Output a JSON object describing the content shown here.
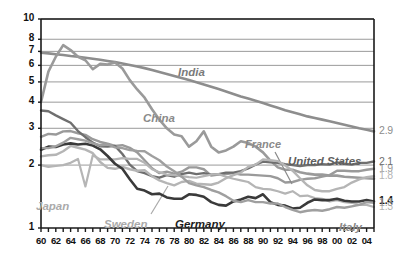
{
  "chart_data": {
    "type": "line",
    "title": "",
    "subtitle": "",
    "xlabel": "",
    "ylabel": "",
    "scale": "log",
    "grid": true,
    "legend_position": "inline-labels",
    "xlim": [
      1960,
      2005
    ],
    "ylim": [
      1,
      10
    ],
    "y_ticks": [
      "10",
      "8",
      "7",
      "6",
      "5",
      "4",
      "3",
      "2",
      "1"
    ],
    "y_tick_values": [
      10,
      8,
      7,
      6,
      5,
      4,
      3,
      2,
      1
    ],
    "x_ticks": [
      "60",
      "62",
      "64",
      "66",
      "68",
      "70",
      "72",
      "74",
      "76",
      "78",
      "80",
      "82",
      "84",
      "86",
      "88",
      "90",
      "92",
      "94",
      "96",
      "98",
      "00",
      "02",
      "04"
    ],
    "x_tick_values": [
      1960,
      1962,
      1964,
      1966,
      1968,
      1970,
      1972,
      1974,
      1976,
      1978,
      1980,
      1982,
      1984,
      1986,
      1988,
      1990,
      1992,
      1994,
      1996,
      1998,
      2000,
      2002,
      2004
    ],
    "x": [
      1960,
      1961,
      1962,
      1963,
      1964,
      1965,
      1966,
      1967,
      1968,
      1969,
      1970,
      1971,
      1972,
      1973,
      1974,
      1975,
      1976,
      1977,
      1978,
      1979,
      1980,
      1981,
      1982,
      1983,
      1984,
      1985,
      1986,
      1987,
      1988,
      1989,
      1990,
      1991,
      1992,
      1993,
      1994,
      1995,
      1996,
      1997,
      1998,
      1999,
      2000,
      2001,
      2002,
      2003,
      2004,
      2005
    ],
    "series": [
      {
        "name": "India",
        "color": "#8d8d8d",
        "width": 2.6,
        "end_value": "2.9",
        "end_value_color": "#8d8d8d",
        "end_value_bold": false,
        "label": "India",
        "label_color": "#7a7a7a",
        "label_size": 11.5,
        "label_x": 178,
        "label_y": 66,
        "values": [
          6.9,
          6.85,
          6.78,
          6.72,
          6.65,
          6.6,
          6.52,
          6.45,
          6.38,
          6.3,
          6.22,
          6.12,
          6.02,
          5.92,
          5.82,
          5.7,
          5.58,
          5.46,
          5.34,
          5.22,
          5.1,
          4.98,
          4.86,
          4.74,
          4.62,
          4.5,
          4.38,
          4.26,
          4.16,
          4.06,
          3.96,
          3.86,
          3.76,
          3.66,
          3.58,
          3.5,
          3.42,
          3.36,
          3.3,
          3.24,
          3.18,
          3.12,
          3.06,
          3.0,
          2.95,
          2.9
        ]
      },
      {
        "name": "China",
        "color": "#9a9a9a",
        "width": 2.6,
        "end_value": "",
        "end_value_color": "#9a9a9a",
        "end_value_bold": false,
        "label": "China",
        "label_color": "#8a8a8a",
        "label_size": 11.5,
        "label_x": 143,
        "label_y": 112,
        "values": [
          4.0,
          5.6,
          6.6,
          7.5,
          7.1,
          6.6,
          6.35,
          5.75,
          6.1,
          6.05,
          6.2,
          5.8,
          5.1,
          4.6,
          4.2,
          3.7,
          3.3,
          3.0,
          2.8,
          2.75,
          2.45,
          2.6,
          2.9,
          2.45,
          2.3,
          2.35,
          2.45,
          2.6,
          2.55,
          2.45,
          2.3,
          2.1,
          1.95,
          1.9,
          1.9,
          1.85,
          1.82,
          1.8,
          1.8,
          1.78,
          1.78,
          1.76,
          1.75,
          1.74,
          1.73,
          1.72
        ]
      },
      {
        "name": "France",
        "color": "#9a9a9a",
        "width": 2.4,
        "end_value": "1.9",
        "end_value_color": "#9a9a9a",
        "end_value_bold": false,
        "label": "France",
        "label_color": "#8a8a8a",
        "label_size": 11,
        "label_x": 245,
        "label_y": 138,
        "leader": [
          275,
          152,
          292,
          184
        ],
        "values": [
          2.73,
          2.82,
          2.8,
          2.9,
          2.91,
          2.84,
          2.79,
          2.66,
          2.58,
          2.53,
          2.47,
          2.49,
          2.42,
          2.3,
          2.11,
          1.93,
          1.83,
          1.86,
          1.82,
          1.86,
          1.95,
          1.95,
          1.91,
          1.78,
          1.8,
          1.81,
          1.83,
          1.8,
          1.8,
          1.79,
          1.78,
          1.77,
          1.73,
          1.65,
          1.66,
          1.7,
          1.72,
          1.73,
          1.76,
          1.79,
          1.88,
          1.88,
          1.87,
          1.87,
          1.9,
          1.92
        ]
      },
      {
        "name": "United States",
        "color": "#6f6f6f",
        "width": 2.4,
        "end_value": "2.1",
        "end_value_color": "#6f6f6f",
        "end_value_bold": false,
        "label": "United States",
        "label_color": "#5e5e5e",
        "label_size": 11.5,
        "label_x": 288,
        "label_y": 155,
        "values": [
          3.65,
          3.62,
          3.46,
          3.32,
          3.19,
          2.91,
          2.72,
          2.56,
          2.46,
          2.45,
          2.47,
          2.26,
          2.01,
          1.87,
          1.83,
          1.77,
          1.74,
          1.79,
          1.76,
          1.81,
          1.84,
          1.81,
          1.83,
          1.8,
          1.81,
          1.84,
          1.84,
          1.87,
          1.93,
          2.01,
          2.08,
          2.06,
          2.05,
          2.02,
          2.0,
          1.98,
          2.0,
          2.0,
          2.02,
          2.01,
          2.06,
          2.03,
          2.01,
          2.05,
          2.05,
          2.08
        ]
      },
      {
        "name": "Sweden",
        "color": "#b5b5b5",
        "width": 2.4,
        "end_value": "1.8",
        "end_value_color": "#b5b5b5",
        "end_value_bold": false,
        "label": "Sweden",
        "label_color": "#aaaaaa",
        "label_size": 11.5,
        "label_x": 104,
        "label_y": 218,
        "leader": [
          151,
          214,
          168,
          186
        ],
        "values": [
          2.2,
          2.23,
          2.24,
          2.33,
          2.47,
          2.42,
          2.37,
          2.28,
          2.07,
          1.94,
          1.92,
          1.96,
          1.91,
          1.88,
          1.89,
          1.77,
          1.69,
          1.64,
          1.6,
          1.66,
          1.68,
          1.63,
          1.62,
          1.61,
          1.65,
          1.73,
          1.79,
          1.84,
          1.96,
          2.01,
          2.13,
          2.11,
          2.09,
          1.99,
          1.88,
          1.73,
          1.6,
          1.52,
          1.5,
          1.5,
          1.54,
          1.57,
          1.65,
          1.71,
          1.75,
          1.77
        ]
      },
      {
        "name": "Japan",
        "color": "#b5b5b5",
        "width": 2.2,
        "end_value": "1.3",
        "end_value_color": "#b5b5b5",
        "end_value_bold": false,
        "label": "Japan",
        "label_color": "#aaaaaa",
        "label_size": 11.5,
        "label_x": 36,
        "label_y": 200,
        "values": [
          2.0,
          1.96,
          1.98,
          2.0,
          2.05,
          2.14,
          1.58,
          2.23,
          2.13,
          2.13,
          2.13,
          2.16,
          2.14,
          2.14,
          2.05,
          1.91,
          1.85,
          1.8,
          1.79,
          1.77,
          1.75,
          1.74,
          1.77,
          1.8,
          1.81,
          1.76,
          1.72,
          1.69,
          1.66,
          1.57,
          1.54,
          1.53,
          1.5,
          1.46,
          1.5,
          1.42,
          1.43,
          1.39,
          1.38,
          1.34,
          1.36,
          1.33,
          1.32,
          1.29,
          1.29,
          1.26
        ]
      },
      {
        "name": "Germany",
        "color": "#3a3a3a",
        "width": 2.6,
        "end_value": "1.4",
        "end_value_color": "#1a1a1a",
        "end_value_bold": true,
        "label": "Germany",
        "label_color": "#1d1d1d",
        "label_size": 11.5,
        "label_x": 175,
        "label_y": 218,
        "values": [
          2.37,
          2.45,
          2.44,
          2.51,
          2.54,
          2.51,
          2.53,
          2.48,
          2.38,
          2.21,
          2.03,
          1.92,
          1.71,
          1.54,
          1.51,
          1.45,
          1.46,
          1.4,
          1.38,
          1.38,
          1.45,
          1.44,
          1.41,
          1.33,
          1.29,
          1.28,
          1.34,
          1.37,
          1.41,
          1.39,
          1.45,
          1.33,
          1.29,
          1.28,
          1.24,
          1.25,
          1.32,
          1.37,
          1.36,
          1.36,
          1.38,
          1.35,
          1.34,
          1.34,
          1.36,
          1.34
        ]
      },
      {
        "name": "Italy",
        "color": "#9f9f9f",
        "width": 2.4,
        "end_value": "1.3",
        "end_value_color": "#9f9f9f",
        "end_value_bold": false,
        "label": "Italy",
        "label_color": "#8a8a8a",
        "label_size": 11.5,
        "label_x": 339,
        "label_y": 221,
        "values": [
          2.41,
          2.41,
          2.46,
          2.56,
          2.7,
          2.66,
          2.62,
          2.54,
          2.49,
          2.51,
          2.43,
          2.41,
          2.36,
          2.34,
          2.33,
          2.21,
          2.11,
          1.97,
          1.87,
          1.76,
          1.64,
          1.6,
          1.57,
          1.52,
          1.48,
          1.42,
          1.35,
          1.33,
          1.36,
          1.33,
          1.33,
          1.31,
          1.31,
          1.26,
          1.22,
          1.19,
          1.21,
          1.22,
          1.21,
          1.23,
          1.26,
          1.25,
          1.27,
          1.29,
          1.33,
          1.32
        ]
      }
    ],
    "end_values_order": [
      "2.9",
      "2.1",
      "1.9",
      "1.8",
      "1.8",
      "1.4",
      "1.3",
      "1.3"
    ]
  },
  "frame": {
    "border_color": "#1a1a1a",
    "grid_color": "#9a9a9a",
    "background": "#ffffff"
  }
}
